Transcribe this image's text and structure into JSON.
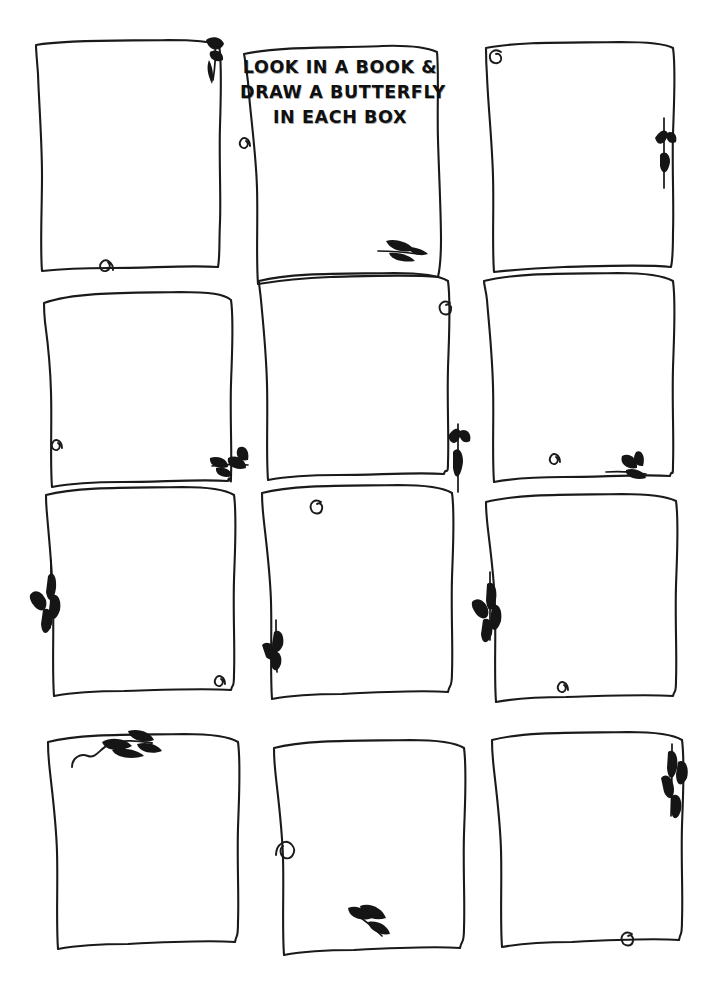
{
  "page": {
    "width": 724,
    "height": 990,
    "background_color": "#ffffff",
    "ink_color": "#1a1a1a",
    "kind": "printable-worksheet"
  },
  "instructions": {
    "line1": "LOOK IN A BOOK &",
    "line2": "DRAW A BUTTERFLY",
    "line3": "IN EACH BOX",
    "full_text": "LOOK IN A BOOK & DRAW A BUTTERFLY IN EACH BOX",
    "located_in_box": "r1c2"
  },
  "grid": {
    "rows": 4,
    "columns": 3,
    "total_boxes": 12
  },
  "boxes": [
    {
      "id": "r1c1",
      "row": 1,
      "col": 1,
      "label": "drawing-box-1",
      "content": ""
    },
    {
      "id": "r1c2",
      "row": 1,
      "col": 2,
      "label": "drawing-box-2",
      "content": ""
    },
    {
      "id": "r1c3",
      "row": 1,
      "col": 3,
      "label": "drawing-box-3",
      "content": ""
    },
    {
      "id": "r2c1",
      "row": 2,
      "col": 1,
      "label": "drawing-box-4",
      "content": ""
    },
    {
      "id": "r2c2",
      "row": 2,
      "col": 2,
      "label": "drawing-box-5",
      "content": ""
    },
    {
      "id": "r2c3",
      "row": 2,
      "col": 3,
      "label": "drawing-box-6",
      "content": ""
    },
    {
      "id": "r3c1",
      "row": 3,
      "col": 1,
      "label": "drawing-box-7",
      "content": ""
    },
    {
      "id": "r3c2",
      "row": 3,
      "col": 2,
      "label": "drawing-box-8",
      "content": ""
    },
    {
      "id": "r3c3",
      "row": 3,
      "col": 3,
      "label": "drawing-box-9",
      "content": ""
    },
    {
      "id": "r4c1",
      "row": 4,
      "col": 1,
      "label": "drawing-box-10",
      "content": ""
    },
    {
      "id": "r4c2",
      "row": 4,
      "col": 2,
      "label": "drawing-box-11",
      "content": ""
    },
    {
      "id": "r4c3",
      "row": 4,
      "col": 3,
      "label": "drawing-box-12",
      "content": ""
    }
  ],
  "decorations": [
    {
      "name": "leaf-sprig-down-icon",
      "near_box": "r1c1",
      "position": "top-right"
    },
    {
      "name": "spiral-curl-icon",
      "near_box": "r1c1",
      "position": "bottom-edge"
    },
    {
      "name": "spiral-curl-icon",
      "near_box": "r1c2",
      "position": "left-edge"
    },
    {
      "name": "leaf-sprig-right-icon",
      "near_box": "r1c2",
      "position": "bottom-right"
    },
    {
      "name": "spiral-curl-icon",
      "near_box": "r1c3",
      "position": "top-left"
    },
    {
      "name": "leaf-sprig-up-icon",
      "near_box": "r1c3",
      "position": "right-edge"
    },
    {
      "name": "spiral-curl-icon",
      "near_box": "r2c1",
      "position": "bottom-left"
    },
    {
      "name": "leaf-sprig-left-icon",
      "near_box": "r2c1",
      "position": "bottom-right"
    },
    {
      "name": "spiral-curl-icon",
      "near_box": "r2c2",
      "position": "top-right"
    },
    {
      "name": "leaf-sprig-up-icon",
      "near_box": "r2c2",
      "position": "bottom-right"
    },
    {
      "name": "spiral-curl-icon",
      "near_box": "r2c3",
      "position": "bottom-left"
    },
    {
      "name": "leaf-sprig-left-icon",
      "near_box": "r2c3",
      "position": "bottom-right"
    },
    {
      "name": "wheat-sprig-down-icon",
      "near_box": "r3c1",
      "position": "left-edge"
    },
    {
      "name": "spiral-curl-icon",
      "near_box": "r3c1",
      "position": "bottom-right"
    },
    {
      "name": "spiral-curl-icon",
      "near_box": "r3c2",
      "position": "top-left"
    },
    {
      "name": "leaf-sprig-down-icon",
      "near_box": "r3c2",
      "position": "left-edge"
    },
    {
      "name": "wheat-sprig-down-icon",
      "near_box": "r3c3",
      "position": "left-edge"
    },
    {
      "name": "spiral-curl-icon",
      "near_box": "r3c3",
      "position": "bottom-left"
    },
    {
      "name": "vine-with-leaves-icon",
      "near_box": "r4c1",
      "position": "top-left"
    },
    {
      "name": "spiral-curl-icon",
      "near_box": "r4c2",
      "position": "left-edge"
    },
    {
      "name": "leaf-sprig-down-icon",
      "near_box": "r4c2",
      "position": "bottom-center"
    },
    {
      "name": "wheat-sprig-up-icon",
      "near_box": "r4c3",
      "position": "top-right"
    },
    {
      "name": "spiral-curl-icon",
      "near_box": "r4c3",
      "position": "bottom-right"
    }
  ]
}
